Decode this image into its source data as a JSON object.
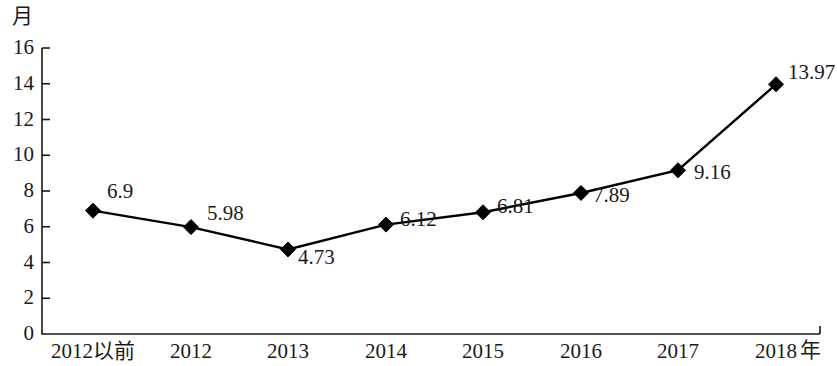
{
  "chart_data": {
    "type": "line",
    "title": "",
    "subtitle": "",
    "xlabel": "年",
    "ylabel": "月",
    "categories": [
      "2012以前",
      "2012",
      "2013",
      "2014",
      "2015",
      "2016",
      "2017",
      "2018"
    ],
    "values": [
      6.9,
      5.98,
      4.73,
      6.12,
      6.81,
      7.89,
      9.16,
      13.97
    ],
    "point_labels": [
      "6.9",
      "5.98",
      "4.73",
      "6.12",
      "6.81",
      "7.89",
      "9.16",
      "13.97"
    ],
    "series": [
      {
        "name": "",
        "values": [
          6.9,
          5.98,
          4.73,
          6.12,
          6.81,
          7.89,
          9.16,
          13.97
        ],
        "marker": "diamond",
        "color": "#000000"
      }
    ],
    "ylim": [
      0,
      16
    ],
    "ytick_step": 2,
    "ytick_labels": [
      "16",
      "14",
      "12",
      "10",
      "8",
      "6",
      "4",
      "2",
      "0"
    ],
    "ytick_values": [
      16,
      14,
      12,
      10,
      8,
      6,
      4,
      2,
      0
    ],
    "grid": false,
    "legend": null,
    "legend_position": "none",
    "axis_color": "#1a1a1a",
    "line_color": "#000000",
    "marker_color": "#000000",
    "background": "#ffffff"
  },
  "axes": {
    "y_unit": "月",
    "x_unit": "年"
  }
}
